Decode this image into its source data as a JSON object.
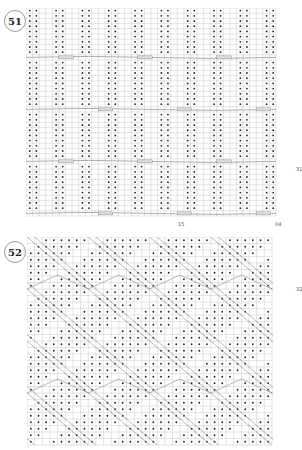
{
  "charts": [
    {
      "number": "51",
      "type": "knitting-chart",
      "grid": {
        "cols": 38,
        "rows": 40
      },
      "labels": {
        "bottom_left": "15",
        "bottom_right": "04",
        "right": "31"
      },
      "pattern": "vertical purl-pair ribs with cable crossings every 10 rows"
    },
    {
      "number": "52",
      "type": "knitting-chart",
      "grid": {
        "cols": 32,
        "rows": 32
      },
      "labels": {
        "right": "32"
      },
      "pattern": "purl dot field with diagonal traveling-stitch chevrons"
    }
  ],
  "colors": {
    "grid": "#bdbdbd",
    "dot": "#222222",
    "cable": "#777777",
    "badge_border": "#999999"
  }
}
